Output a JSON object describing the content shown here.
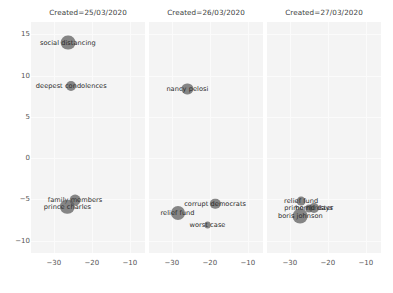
{
  "chart_data": {
    "type": "scatter",
    "title": "",
    "xlabel": "",
    "ylabel": "",
    "xlim": [
      -36,
      -6
    ],
    "ylim": [
      -11.5,
      16.5
    ],
    "xticks": [
      -30,
      -20,
      -10
    ],
    "xtick_labels": [
      "−30",
      "−20",
      "−10"
    ],
    "yticks": [
      15,
      10,
      5,
      0,
      -5,
      -10
    ],
    "ytick_labels": [
      "15",
      "10",
      "5",
      "0",
      "−5",
      "−10"
    ],
    "grid": true,
    "legend": false,
    "facet_variable": "Created",
    "marker_color": "#5a5a5a",
    "background_color": "#f4f4f4",
    "panels": [
      {
        "title": "Created=25/03/2020",
        "points": [
          {
            "label": "social distancing",
            "x": -26.3,
            "y": 14.0,
            "size": 7.4
          },
          {
            "label": "deepest condolences",
            "x": -25.4,
            "y": 8.8,
            "size": 5.0
          },
          {
            "label": "family members",
            "x": -24.4,
            "y": -5.1,
            "size": 5.4
          },
          {
            "label": "prince charles",
            "x": -26.4,
            "y": -5.9,
            "size": 7.2
          }
        ]
      },
      {
        "title": "Created=26/03/2020",
        "points": [
          {
            "label": "nancy pelosi",
            "x": -25.9,
            "y": 8.4,
            "size": 5.6
          },
          {
            "label": "corrupt democrats",
            "x": -18.6,
            "y": -5.5,
            "size": 5.2
          },
          {
            "label": "relief fund",
            "x": -28.5,
            "y": -6.6,
            "size": 7.0
          },
          {
            "label": "worst case",
            "x": -20.6,
            "y": -8.1,
            "size": 3.4
          }
        ]
      },
      {
        "title": "Created=27/03/2020",
        "points": [
          {
            "label": "relief fund",
            "x": -27.0,
            "y": -5.2,
            "size": 4.4
          },
          {
            "label": "prime minister",
            "x": -25.0,
            "y": -6.1,
            "size": 3.6
          },
          {
            "label": "horrid days",
            "x": -23.6,
            "y": -6.1,
            "size": 5.0
          },
          {
            "label": "boris johnson",
            "x": -27.2,
            "y": -7.0,
            "size": 7.4
          }
        ]
      }
    ]
  }
}
